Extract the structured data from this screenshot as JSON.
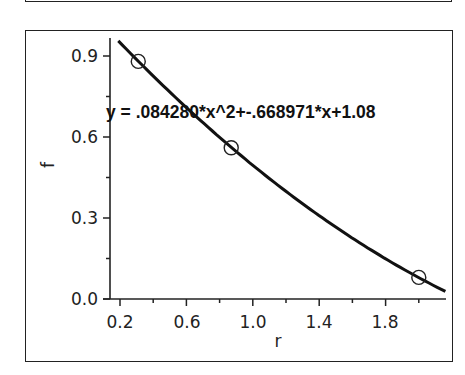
{
  "chart_data": {
    "type": "scatter",
    "title": "",
    "xlabel": "r",
    "ylabel": "f",
    "xlim": [
      0.14,
      2.16
    ],
    "ylim": [
      0.0,
      0.96
    ],
    "x_ticks": [
      0.2,
      0.6,
      1.0,
      1.4,
      1.8
    ],
    "x_tick_labels": [
      "0.2",
      "0.6",
      "1.0",
      "1.4",
      "1.8"
    ],
    "x_minor_ticks": [
      0.4,
      0.8,
      1.2,
      1.6,
      2.0
    ],
    "y_ticks": [
      0.0,
      0.3,
      0.6,
      0.9
    ],
    "y_tick_labels": [
      "0.0",
      "0.3",
      "0.6",
      "0.9"
    ],
    "y_minor_ticks": [
      0.15,
      0.45,
      0.75
    ],
    "grid": false,
    "legend": null,
    "series": [
      {
        "name": "data",
        "marker": "open-circle",
        "x": [
          0.31,
          0.87,
          2.0
        ],
        "y": [
          0.88,
          0.56,
          0.08
        ]
      },
      {
        "name": "quadratic fit",
        "type": "line",
        "equation": "y = .084280*x^2+-.668971*x+1.08",
        "coefficients": {
          "a": 0.08428,
          "b": -0.668971,
          "c": 1.08
        }
      }
    ],
    "annotations": [
      {
        "text": "y = .084280*x^2+-.668971*x+1.08",
        "x": 0.14,
        "y": 0.65
      }
    ]
  },
  "labels": {
    "xlabel": "r",
    "ylabel": "f",
    "equation": "y = .084280*x^2+-.668971*x+1.08",
    "x_ticks": [
      "0.2",
      "0.6",
      "1.0",
      "1.4",
      "1.8"
    ],
    "y_ticks": [
      "0.0",
      "0.3",
      "0.6",
      "0.9"
    ]
  },
  "colors": {
    "line": "#111111",
    "axis": "#222222",
    "marker_stroke": "#222222",
    "background": "#ffffff"
  }
}
